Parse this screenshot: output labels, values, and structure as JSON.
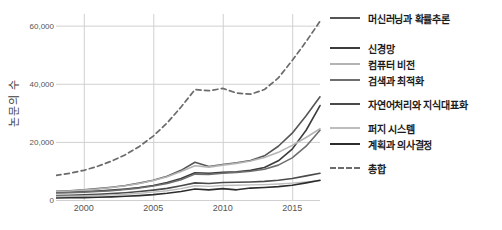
{
  "chart_data": {
    "type": "line",
    "title": "",
    "xlabel": "",
    "ylabel": "논문의 수",
    "xlim": [
      1998,
      2017
    ],
    "ylim": [
      0,
      64000
    ],
    "grid": true,
    "legend_position": "right",
    "x": [
      1998,
      1999,
      2000,
      2001,
      2002,
      2003,
      2004,
      2005,
      2006,
      2007,
      2008,
      2009,
      2010,
      2011,
      2012,
      2013,
      2014,
      2015,
      2016,
      2017
    ],
    "xticks": [
      "2000",
      "2005",
      "2010",
      "2015"
    ],
    "xtick_values": [
      2000,
      2005,
      2010,
      2015
    ],
    "yticks": [
      "0",
      "20,000",
      "40,000",
      "60,000"
    ],
    "ytick_values": [
      0,
      20000,
      40000,
      60000
    ],
    "series": [
      {
        "name": "머신러닝과 확률추론",
        "color": "#555555",
        "dash": "solid",
        "width": 1.6,
        "values": [
          3000,
          3200,
          3500,
          3900,
          4400,
          5000,
          5800,
          6800,
          8200,
          10200,
          13000,
          11500,
          12200,
          12800,
          13600,
          15200,
          18500,
          23000,
          29000,
          35500
        ]
      },
      {
        "name": "신경망",
        "color": "#3c3c3c",
        "dash": "solid",
        "width": 1.6,
        "values": [
          2600,
          2700,
          2900,
          3100,
          3400,
          3800,
          4300,
          5000,
          6000,
          7400,
          9400,
          9200,
          9500,
          9700,
          10200,
          11200,
          13500,
          17500,
          24000,
          32500
        ]
      },
      {
        "name": "컴퓨터 비전",
        "color": "#b4b4b4",
        "dash": "solid",
        "width": 1.6,
        "values": [
          2900,
          3100,
          3400,
          3800,
          4300,
          4900,
          5700,
          6700,
          8000,
          9800,
          11800,
          11300,
          12000,
          12600,
          13400,
          14600,
          16400,
          18800,
          21500,
          24500
        ]
      },
      {
        "name": "검색과 최적화",
        "color": "#6e6e6e",
        "dash": "solid",
        "width": 1.6,
        "values": [
          2400,
          2500,
          2700,
          2900,
          3200,
          3600,
          4100,
          4800,
          5700,
          7000,
          8900,
          8800,
          9200,
          9500,
          9900,
          10600,
          12000,
          14500,
          18500,
          24000
        ]
      },
      {
        "name": "자연어처리와 지식대표화",
        "color": "#4a4a4a",
        "dash": "solid",
        "width": 1.6,
        "values": [
          1500,
          1600,
          1750,
          1950,
          2200,
          2500,
          2900,
          3400,
          4000,
          4900,
          5900,
          5700,
          6000,
          6100,
          6200,
          6400,
          6800,
          7400,
          8300,
          9200
        ]
      },
      {
        "name": "퍼지 시스템",
        "color": "#bdbdbd",
        "dash": "solid",
        "width": 1.4,
        "values": [
          1200,
          1300,
          1400,
          1550,
          1750,
          2000,
          2300,
          2700,
          3200,
          3900,
          4900,
          4700,
          5000,
          5100,
          5200,
          5300,
          5500,
          5800,
          6200,
          6600
        ]
      },
      {
        "name": "계획과 의사결정",
        "color": "#2d2d2d",
        "dash": "solid",
        "width": 1.6,
        "values": [
          700,
          760,
          830,
          930,
          1080,
          1280,
          1520,
          1850,
          2300,
          2950,
          3800,
          3500,
          3900,
          3500,
          4100,
          4300,
          4600,
          5100,
          5900,
          6800
        ]
      },
      {
        "name": "총합",
        "color": "#6b6b6b",
        "dash": "dashed",
        "width": 1.7,
        "values": [
          8500,
          9200,
          10200,
          11600,
          13400,
          15600,
          18400,
          22000,
          26500,
          32000,
          38000,
          37600,
          38400,
          36800,
          36400,
          38000,
          42000,
          48000,
          54500,
          61500
        ]
      }
    ]
  },
  "legend": {
    "rows": [
      {
        "label": "머신러닝과 확률추론",
        "top": 11,
        "color": "#555555",
        "dash": "solid",
        "thickness": 2
      },
      {
        "label": "신경망",
        "top": 41,
        "color": "#3c3c3c",
        "dash": "solid",
        "thickness": 2.4
      },
      {
        "label": "컴퓨터 비전",
        "top": 57,
        "color": "#b4b4b4",
        "dash": "solid",
        "thickness": 2
      },
      {
        "label": "검색과 최적화",
        "top": 73,
        "color": "#6e6e6e",
        "dash": "solid",
        "thickness": 2
      },
      {
        "label": "자연어처리와 지식대표화",
        "top": 97,
        "color": "#4a4a4a",
        "dash": "solid",
        "thickness": 2.4
      },
      {
        "label": "퍼지 시스템",
        "top": 121,
        "color": "#bdbdbd",
        "dash": "solid",
        "thickness": 2
      },
      {
        "label": "계획과 의사결정",
        "top": 137,
        "color": "#2d2d2d",
        "dash": "solid",
        "thickness": 2.6
      },
      {
        "label": "총합",
        "top": 161,
        "color": "#6b6b6b",
        "dash": "dashed",
        "thickness": 2.2
      }
    ]
  },
  "colors": {
    "grid": "#d0d0d0",
    "axis_text": "#555555",
    "label_text": "#3d3d3d",
    "legend_text": "#1a1a1a",
    "background": "#ffffff"
  }
}
